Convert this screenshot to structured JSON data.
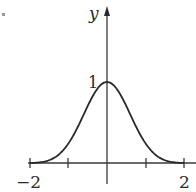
{
  "chart_data": {
    "type": "line",
    "title": "",
    "xlabel": "",
    "ylabel": "y",
    "x": [
      -2,
      -1.75,
      -1.5,
      -1.25,
      -1,
      -0.75,
      -0.5,
      -0.25,
      0,
      0.25,
      0.5,
      0.75,
      1,
      1.25,
      1.5,
      1.75,
      2
    ],
    "series": [
      {
        "name": "bell curve",
        "values": [
          0.0,
          0.01,
          0.04,
          0.11,
          0.25,
          0.45,
          0.7,
          0.92,
          1.0,
          0.92,
          0.7,
          0.45,
          0.25,
          0.11,
          0.04,
          0.01,
          0.0
        ]
      }
    ],
    "xlim": [
      -2,
      2
    ],
    "ylim": [
      0,
      1
    ],
    "x_tick_labels": [
      "-2",
      "2"
    ],
    "x_ticks": [
      -2,
      -1,
      1,
      2
    ],
    "y_tick_labels": [
      "1"
    ],
    "grid": false,
    "legend": "none"
  },
  "labels": {
    "y_axis": "y",
    "y_one": "1",
    "x_neg_two": "−2",
    "x_two": "2"
  },
  "colors": {
    "curve": "#2a2a2a",
    "axis": "#3a3a3a"
  }
}
